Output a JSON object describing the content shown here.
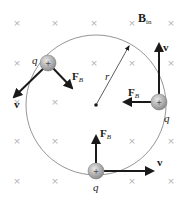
{
  "diagram": {
    "field_label": {
      "main": "B",
      "sub": "in"
    },
    "radius_label": "r",
    "charge_symbol": "+",
    "charge_label": "q",
    "force_label": {
      "main": "F",
      "sub": "B"
    },
    "velocity_label": "v",
    "field_marks": {
      "symbol": "×",
      "xs": [
        17,
        55,
        94,
        132,
        171
      ],
      "ys": [
        23,
        63,
        102,
        141,
        181
      ]
    },
    "circle": {
      "cx": 96,
      "cy": 105,
      "r": 70
    },
    "charges": [
      {
        "position": "upper-left",
        "x": 48,
        "y": 63
      },
      {
        "position": "right",
        "x": 159,
        "y": 102
      },
      {
        "position": "bottom",
        "x": 96,
        "y": 171
      }
    ],
    "colors": {
      "circle": "#7a7a7a",
      "field_mark": "#b0b0b0",
      "arrow": "#1a1a1a",
      "charge_fill": "#b8b8b8"
    }
  }
}
